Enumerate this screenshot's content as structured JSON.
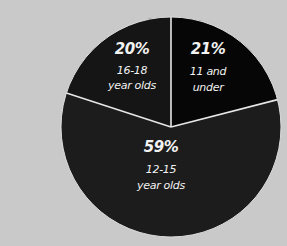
{
  "chart_data": {
    "type": "pie",
    "title": "",
    "categories": [
      "11 and under",
      "12-15 year olds",
      "16-18 year olds"
    ],
    "values": [
      21,
      59,
      20
    ],
    "unit": "%",
    "slices": [
      {
        "pct_label": "21%",
        "line1": "11 and",
        "line2": "under",
        "value": 21,
        "color": "#060606"
      },
      {
        "pct_label": "59%",
        "line1": "12-15",
        "line2": "year olds",
        "value": 59,
        "color": "#1c1c1c"
      },
      {
        "pct_label": "20%",
        "line1": "16-18",
        "line2": "year olds",
        "value": 20,
        "color": "#151515"
      }
    ],
    "divider_color": "#e6e6e6",
    "background_color": "#c9c9c9",
    "legend": "none",
    "start_angle_deg": 0,
    "direction": "clockwise"
  }
}
